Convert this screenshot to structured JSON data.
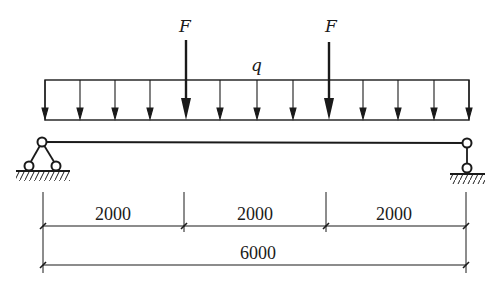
{
  "diagram": {
    "type": "simply-supported-beam",
    "colors": {
      "ink": "#1a1a1a",
      "background": "#ffffff"
    },
    "loads": {
      "distributed": {
        "label": "q",
        "direction": "down"
      },
      "point_loads": [
        {
          "label": "F",
          "position_mm": 2000
        },
        {
          "label": "F",
          "position_mm": 4000
        }
      ]
    },
    "supports": {
      "left": {
        "type": "fixed-pin-support"
      },
      "right": {
        "type": "roller-link-support"
      }
    },
    "dimensions": {
      "segments": [
        {
          "label": "2000"
        },
        {
          "label": "2000"
        },
        {
          "label": "2000"
        }
      ],
      "total": {
        "label": "6000"
      }
    }
  }
}
